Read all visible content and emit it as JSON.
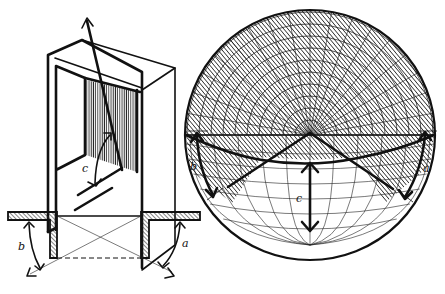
{
  "figure": {
    "labels": {
      "doorway_angle": "c",
      "plan_left_angle": "b",
      "plan_right_angle": "a",
      "sphere_left_angle": "b",
      "sphere_right_angle": "a",
      "sphere_vertical_angle": "c"
    },
    "colors": {
      "ink": "#111111",
      "paper": "#ffffff"
    }
  }
}
